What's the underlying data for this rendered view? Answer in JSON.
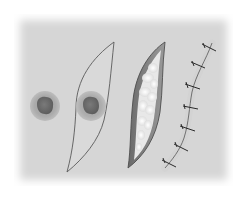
{
  "figure": {
    "steps": [
      {
        "id": "lesion",
        "name": "Skin lesion"
      },
      {
        "id": "incision-outline",
        "name": "Elliptical incision outline around lesion"
      },
      {
        "id": "open-wound",
        "name": "Excised elliptical wound exposing subcutaneous fat"
      },
      {
        "id": "sutured-closure",
        "name": "Closed wound with interrupted sutures",
        "suture_count": 7
      }
    ],
    "colors": {
      "background": "#d6d6d6",
      "lesion_halo": "#a8a8a8",
      "lesion_core": "#6f6f6f",
      "outline": "#5a5a5a",
      "fat": "#f2f2f2",
      "suture": "#2a2a2a"
    }
  }
}
